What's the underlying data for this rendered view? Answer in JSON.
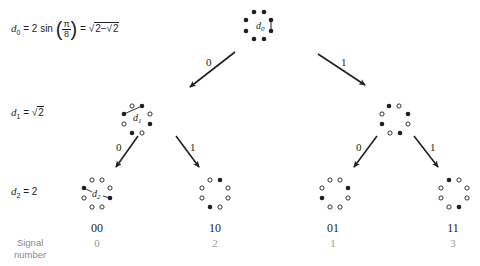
{
  "equations": {
    "d0_lhs": "d",
    "d0_sub": "0",
    "d0_mid": " = 2 sin ",
    "d0_num": "π",
    "d0_den": "8",
    "d0_rhs_prefix": " = ",
    "d0_rhs_sqrt": "2−",
    "d0_rhs_inner": "2",
    "d1_lhs": "d",
    "d1_sub": "1",
    "d1_rhs_prefix": " = ",
    "d1_rhs_inner": "2",
    "d2_lhs": "d",
    "d2_sub": "2",
    "d2_rhs": " = 2"
  },
  "tree": {
    "root": {
      "label": "d0",
      "filled": [
        true,
        true,
        true,
        true,
        true,
        true,
        true,
        true
      ]
    },
    "level1": [
      {
        "branch": "0",
        "distance_label": "d1"
      },
      {
        "branch": "1"
      }
    ],
    "level2": [
      {
        "branch": "0",
        "code": "00",
        "signal": "0",
        "distance_label": "d2"
      },
      {
        "branch": "1",
        "code": "10",
        "signal": "2"
      },
      {
        "branch": "0",
        "code": "01",
        "signal": "1"
      },
      {
        "branch": "1",
        "code": "11",
        "signal": "3"
      }
    ]
  },
  "signal_label": {
    "line1": "Signal",
    "line2": "number"
  },
  "colors": {
    "ink": "#231f20",
    "muted": "#8a8a8a",
    "background": "#ffffff"
  }
}
